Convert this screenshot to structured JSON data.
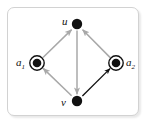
{
  "figure": {
    "frame": {
      "border_color": "#d2d2d2",
      "background": "#ffffff",
      "shadow_color": "rgba(0,0,0,0.09)"
    }
  },
  "graph": {
    "type": "directed-graph",
    "colors": {
      "node_fill": "#111111",
      "node_ring": "#111111",
      "edge_gray": "#a8a8a8",
      "edge_black": "#111111",
      "background": "#ffffff"
    },
    "nodes": [
      {
        "id": "u",
        "label": "u",
        "label_sub": "",
        "style": "filled-dot",
        "x": 77,
        "y": 24,
        "radius": 5.2,
        "label_x": 62,
        "label_y": 16
      },
      {
        "id": "v",
        "label": "v",
        "label_sub": "",
        "style": "filled-dot",
        "x": 77,
        "y": 101,
        "radius": 5.2,
        "label_x": 61,
        "label_y": 97
      },
      {
        "id": "a1",
        "label": "a",
        "label_sub": "1",
        "style": "double-circle-dot",
        "x": 37,
        "y": 63,
        "radius": 4.6,
        "outer_radius": 7.6,
        "label_x": 16,
        "label_y": 57
      },
      {
        "id": "a2",
        "label": "a",
        "label_sub": "2",
        "style": "double-circle-dot",
        "x": 116,
        "y": 63,
        "radius": 4.6,
        "outer_radius": 7.6,
        "label_x": 126,
        "label_y": 57
      }
    ],
    "edges": [
      {
        "id": "a1-u",
        "from": "a1",
        "to": "u",
        "color": "gray",
        "arrow": "to"
      },
      {
        "id": "a2-u",
        "from": "a2",
        "to": "u",
        "color": "gray",
        "arrow": "to"
      },
      {
        "id": "u-v",
        "from": "u",
        "to": "v",
        "color": "gray",
        "arrow": "to"
      },
      {
        "id": "v-a1",
        "from": "v",
        "to": "a1",
        "color": "gray",
        "arrow": "to"
      },
      {
        "id": "v-a2",
        "from": "v",
        "to": "a2",
        "color": "black",
        "arrow": "to"
      }
    ]
  }
}
